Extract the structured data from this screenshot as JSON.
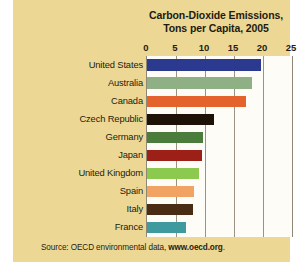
{
  "chart_data": {
    "type": "bar",
    "orientation": "horizontal",
    "title": "Carbon-Dioxide Emissions, Tons per Capita, 2005",
    "title_line1": "Carbon-Dioxide Emissions,",
    "title_line2": "Tons per Capita, 2005",
    "xlabel": "",
    "ylabel": "",
    "xlim": [
      0,
      25
    ],
    "xticks": [
      0,
      5,
      10,
      15,
      20,
      25
    ],
    "xtick_labels": [
      "0",
      "5",
      "10",
      "15",
      "20",
      "25"
    ],
    "grid": "vertical",
    "legend": "none",
    "categories": [
      "United States",
      "Australia",
      "Canada",
      "Czech Republic",
      "Germany",
      "Japan",
      "United Kingdom",
      "Spain",
      "Italy",
      "France"
    ],
    "values": [
      19.6,
      18.1,
      17.0,
      11.5,
      9.7,
      9.4,
      9.0,
      8.1,
      7.9,
      6.7
    ],
    "bar_colors": [
      "#2b3a8f",
      "#8faf84",
      "#e4622c",
      "#1d1108",
      "#4c7c3c",
      "#9c1f18",
      "#8cc churches",
      "#f0a362",
      "#4a2c14",
      "#3f9aa0"
    ],
    "series": [
      {
        "name": "CO2 tons per capita",
        "points": [
          {
            "category": "United States",
            "value": 19.6,
            "color": "#2b3a8f"
          },
          {
            "category": "Australia",
            "value": 18.1,
            "color": "#8faf84"
          },
          {
            "category": "Canada",
            "value": 17.0,
            "color": "#e4622c"
          },
          {
            "category": "Czech Republic",
            "value": 11.5,
            "color": "#1d1108"
          },
          {
            "category": "Germany",
            "value": 9.7,
            "color": "#4c7c3c"
          },
          {
            "category": "Japan",
            "value": 9.4,
            "color": "#9c1f18"
          },
          {
            "category": "United Kingdom",
            "value": 9.0,
            "color": "#8cc94f"
          },
          {
            "category": "Spain",
            "value": 8.1,
            "color": "#f0a362"
          },
          {
            "category": "Italy",
            "value": 7.9,
            "color": "#4a2c14"
          },
          {
            "category": "France",
            "value": 6.7,
            "color": "#3f9aa0"
          }
        ]
      }
    ]
  },
  "source": {
    "prefix": "Source: OECD environmental data, ",
    "url": "www.oecd.org",
    "suffix": "."
  },
  "colors": {
    "panel_background": "#ecd894",
    "plot_background": "#fdfcf7",
    "gridline": "#9a9382",
    "text": "#241b11"
  }
}
